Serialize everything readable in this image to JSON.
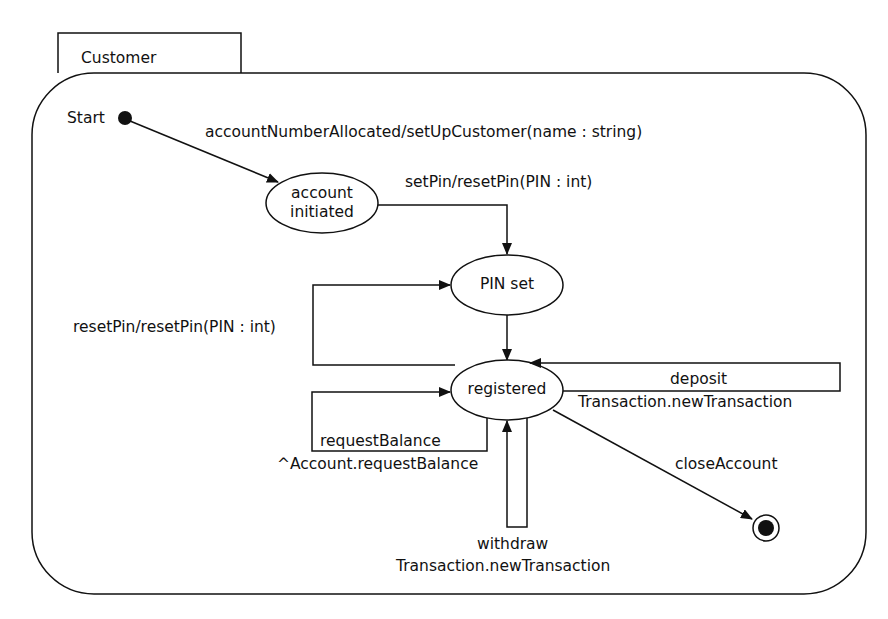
{
  "diagram": {
    "type": "UML state machine",
    "container": {
      "name": "Customer"
    },
    "start": {
      "label": "Start"
    },
    "states": [
      {
        "id": "account_initiated",
        "line1": "account",
        "line2": "initiated"
      },
      {
        "id": "pin_set",
        "label": "PIN set"
      },
      {
        "id": "registered",
        "label": "registered"
      }
    ],
    "transitions": [
      {
        "from": "start",
        "to": "account_initiated",
        "label": "accountNumberAllocated/setUpCustomer(name : string)"
      },
      {
        "from": "account_initiated",
        "to": "pin_set",
        "label": "setPin/resetPin(PIN : int)"
      },
      {
        "from": "registered",
        "to": "pin_set",
        "label": "resetPin/resetPin(PIN : int)"
      },
      {
        "from": "pin_set",
        "to": "registered",
        "label": ""
      },
      {
        "from": "registered",
        "to": "registered",
        "line1": "requestBalance",
        "line2": "^Account.requestBalance"
      },
      {
        "from": "registered",
        "to": "registered",
        "line1": "deposit",
        "line2": "Transaction.newTransaction"
      },
      {
        "from": "registered",
        "to": "registered",
        "line1": "withdraw",
        "line2": "Transaction.newTransaction"
      },
      {
        "from": "registered",
        "to": "final",
        "label": "closeAccount"
      }
    ],
    "final": {
      "label": ""
    },
    "colors": {
      "stroke": "#111111",
      "background": "#ffffff"
    }
  }
}
